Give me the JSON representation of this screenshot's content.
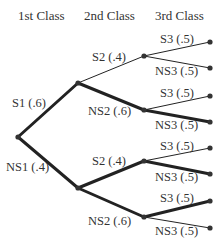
{
  "headers": {
    "level1": "1st Class",
    "level2": "2nd Class",
    "level3": "3rd Class"
  },
  "labels": {
    "s1": "S1 (.6)",
    "ns1": "NS1 (.4)",
    "s1_s2": "S2 (.4)",
    "s1_ns2": "NS2 (.6)",
    "ns1_s2": "S2 (.4)",
    "ns1_ns2": "NS2 (.6)",
    "s1_s2_s3": "S3 (.5)",
    "s1_s2_ns3": "NS3 (.5)",
    "s1_ns2_s3": "S3 (.5)",
    "s1_ns2_ns3": "NS3 (.5)",
    "ns1_s2_s3": "S3 (.5)",
    "ns1_s2_ns3": "NS3 (.5)",
    "ns1_ns2_s3": "S3 (.5)",
    "ns1_ns2_ns3": "NS3 (.5)"
  },
  "colors": {
    "line": "#222222",
    "node": "#333333",
    "text": "#333333"
  }
}
